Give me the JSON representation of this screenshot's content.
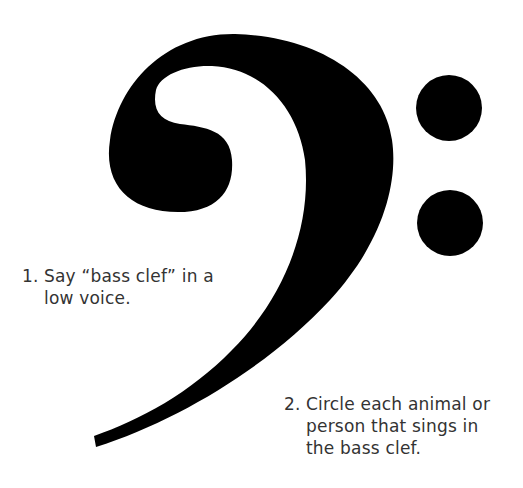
{
  "figure": {
    "symbol": "bass-clef-icon",
    "ink_color": "#000000",
    "background": "#ffffff"
  },
  "instructions": [
    {
      "number": "1.",
      "lines": [
        "Say “bass clef” in a",
        "low voice."
      ]
    },
    {
      "number": "2.",
      "lines": [
        "Circle each animal or",
        "person that sings in",
        "the bass clef."
      ]
    }
  ]
}
